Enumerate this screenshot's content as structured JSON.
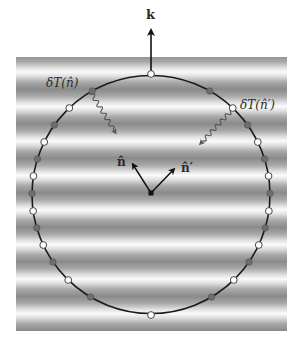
{
  "figure": {
    "background": {
      "x": 16,
      "y": 57,
      "width": 271,
      "height": 274,
      "stripe_period": 34.5,
      "bright_color": "#fbfbfb",
      "dark_color": "#8a8a8a",
      "first_bright_y": 72
    },
    "circle": {
      "cx": 151,
      "cy": 194.5,
      "r": 119,
      "stroke": "#1a1a1a"
    },
    "wave_vector": {
      "label": "k",
      "from": [
        151,
        74
      ],
      "to": [
        151,
        28
      ]
    },
    "center_point": {
      "x": 151,
      "y": 193
    },
    "direction_vectors": [
      {
        "id": "n",
        "label": "n̂",
        "to": [
          132,
          163
        ]
      },
      {
        "id": "n_prime",
        "label": "n̂′",
        "to": [
          175,
          168
        ]
      }
    ],
    "temperature_labels": [
      {
        "id": "dT_n",
        "text": "δT(n̂)",
        "x": 46,
        "y": 77
      },
      {
        "id": "dT_nprime",
        "text": "δT(n̂′)",
        "x": 240,
        "y": 99
      }
    ],
    "photon_paths": [
      {
        "id": "photon-n",
        "from": [
          90,
          91
        ],
        "to": [
          115,
          132
        ]
      },
      {
        "id": "photon-nprime",
        "from": [
          233,
          109
        ],
        "to": [
          201,
          143
        ]
      }
    ],
    "nodes": {
      "open_color": "#ffffff",
      "filled_color": "#6e6e6e",
      "y_positions": [
        74,
        91,
        108,
        125,
        142,
        159,
        176,
        193.5,
        211,
        228,
        245,
        262,
        280,
        297,
        315
      ],
      "types": [
        "open",
        "filled",
        "open",
        "filled",
        "open",
        "filled",
        "open",
        "filled",
        "open",
        "filled",
        "open",
        "filled",
        "open",
        "filled",
        "open"
      ]
    }
  }
}
